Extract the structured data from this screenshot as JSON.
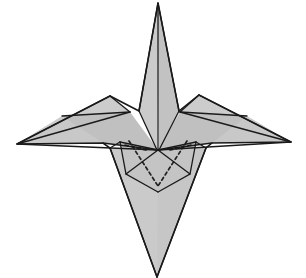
{
  "figure": {
    "canvas": {
      "width": 306,
      "height": 278,
      "background": "#ffffff"
    },
    "style": {
      "paper_fill_light": "#d0d0d0",
      "paper_fill_mid": "#c6c6c6",
      "paper_fill_dark": "#b8b8b8",
      "paper_fill_shadow": "#ababab",
      "edge_stroke": "#1a1a1a",
      "edge_width": 1.6,
      "crease_stroke": "#1a1a1a",
      "crease_width": 1.3,
      "hidden_stroke": "#222222",
      "hidden_width": 1.7,
      "hidden_dash": "3.2 3.0"
    },
    "key_points": {
      "top_tip": [
        158,
        3
      ],
      "bottom_tip": [
        157,
        277
      ],
      "left_tip": [
        17,
        144
      ],
      "right_tip": [
        291,
        142
      ],
      "center": [
        158,
        150
      ],
      "inner_v_bottom": [
        158,
        192
      ]
    },
    "shapes": [
      {
        "name": "bottom-spike-body",
        "kind": "face",
        "fill": "#c6c6c6",
        "points": "110,148 206,148 157,277"
      },
      {
        "name": "bottom-spike-left-shade",
        "kind": "face",
        "fill": "#cacaca",
        "points": "110,148 158,150 157,277"
      },
      {
        "name": "left-wing-lower",
        "kind": "face",
        "fill": "#c8c8c8",
        "points": "17,144 110,96 158,150 103,143"
      },
      {
        "name": "left-wing-upper",
        "kind": "face",
        "fill": "#cccccc",
        "points": "17,144 110,96 130,112 62,116"
      },
      {
        "name": "left-wing-band",
        "kind": "face",
        "fill": "#c0c0c0",
        "points": "62,116 130,112 158,150 103,143"
      },
      {
        "name": "right-wing-lower",
        "kind": "face",
        "fill": "#c8c8c8",
        "points": "291,142 199,95 158,150 212,143"
      },
      {
        "name": "right-wing-upper",
        "kind": "face",
        "fill": "#cccccc",
        "points": "291,142 199,95 180,112 247,116"
      },
      {
        "name": "right-wing-band",
        "kind": "face",
        "fill": "#c0c0c0",
        "points": "247,116 180,112 158,150 212,143"
      },
      {
        "name": "top-spike-left",
        "kind": "face",
        "fill": "#cbcbcb",
        "points": "158,3 139,111 157,150"
      },
      {
        "name": "top-spike-right",
        "kind": "face",
        "fill": "#c2c2c2",
        "points": "158,3 179,111 159,150"
      },
      {
        "name": "inner-flap-left",
        "kind": "face",
        "fill": "#bdbdbd",
        "points": "120,142 158,150 126,174"
      },
      {
        "name": "inner-flap-right",
        "kind": "face",
        "fill": "#bdbdbd",
        "points": "196,142 158,150 190,174"
      },
      {
        "name": "inner-pocket",
        "kind": "face",
        "fill": "#c4c4c4",
        "points": "120,142 158,150 196,142 190,174 158,192 126,174"
      }
    ],
    "edges": [
      {
        "name": "outline-main",
        "d": "M158,3 L179,111 L199,95 L291,142 L212,143 L206,148 L157,277 L110,148 L103,143 L17,144 L110,96 L139,111 Z"
      },
      {
        "name": "left-wing-top-edge",
        "d": "M17,144 L110,96"
      },
      {
        "name": "left-wing-inner-edge",
        "d": "M110,96 L130,112"
      },
      {
        "name": "left-wing-crease-long",
        "d": "M17,144 L130,112"
      },
      {
        "name": "left-wing-crease-band",
        "d": "M62,116 L130,112"
      },
      {
        "name": "left-wing-to-center",
        "d": "M17,144 L158,150"
      },
      {
        "name": "left-wing-notch",
        "d": "M103,143 L158,150"
      },
      {
        "name": "right-wing-top-edge",
        "d": "M291,142 L199,95"
      },
      {
        "name": "right-wing-inner-edge",
        "d": "M199,95 L180,112"
      },
      {
        "name": "right-wing-crease-long",
        "d": "M291,142 L180,112"
      },
      {
        "name": "right-wing-crease-band",
        "d": "M247,116 L180,112"
      },
      {
        "name": "right-wing-to-center",
        "d": "M291,142 L158,150"
      },
      {
        "name": "right-wing-notch",
        "d": "M212,143 L158,150"
      },
      {
        "name": "top-spike-left-edge",
        "d": "M158,3 L139,111 L157,150"
      },
      {
        "name": "top-spike-right-edge",
        "d": "M158,3 L179,111 L159,150"
      },
      {
        "name": "top-spike-center-crease",
        "d": "M158,6 L158,150"
      },
      {
        "name": "body-left-edge",
        "d": "M110,148 L157,277"
      },
      {
        "name": "body-right-edge",
        "d": "M206,148 L157,277"
      },
      {
        "name": "body-shoulder-left",
        "d": "M110,148 L120,142"
      },
      {
        "name": "body-shoulder-right",
        "d": "M206,148 L196,142"
      },
      {
        "name": "pocket-rim-left",
        "d": "M120,142 L126,174 L158,192"
      },
      {
        "name": "pocket-rim-right",
        "d": "M196,142 L190,174 L158,192"
      },
      {
        "name": "pocket-top-left",
        "d": "M120,142 L158,150"
      },
      {
        "name": "pocket-top-right",
        "d": "M196,142 L158,150"
      },
      {
        "name": "flap-fold-left",
        "d": "M158,150 L126,174"
      },
      {
        "name": "flap-fold-right",
        "d": "M158,150 L190,174"
      }
    ],
    "hidden_creases": [
      {
        "name": "hidden-crease-left",
        "d": "M129,141 L158,186"
      },
      {
        "name": "hidden-crease-right",
        "d": "M187,141 L158,186"
      },
      {
        "name": "hidden-crease-left-short",
        "d": "M125,145 L146,150"
      },
      {
        "name": "hidden-crease-right-short",
        "d": "M191,145 L170,150"
      }
    ]
  }
}
